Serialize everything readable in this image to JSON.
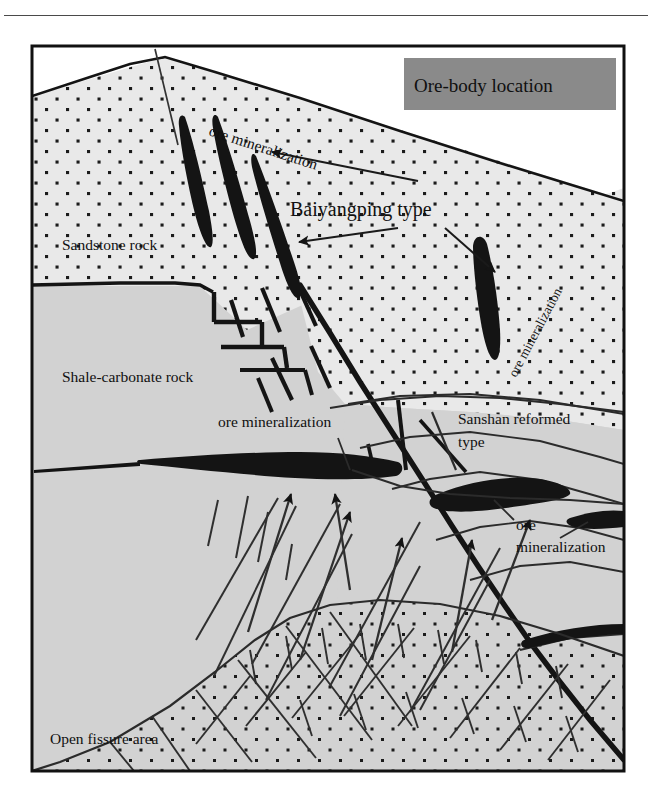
{
  "figure": {
    "kind": "geological-cross-section",
    "frame": {
      "x": 31,
      "y": 45,
      "width": 594,
      "height": 727
    },
    "top_rule_color": "#4a4a4a"
  },
  "title_box": {
    "label": "Ore-body location",
    "fill": "#8a8a8a",
    "text_color": "#101010",
    "x": 404,
    "y": 58,
    "width": 212,
    "height": 52
  },
  "units": [
    {
      "name": "sandstone-rock",
      "label": "Sandstone rock",
      "fill": "#e9e9e9",
      "pattern": "stipple-dots",
      "label_x": 62,
      "label_y": 250
    },
    {
      "name": "shale-carbonate-rock",
      "label": "Shale-carbonate rock",
      "fill": "#d2d2d2",
      "pattern": "solid",
      "label_x": 62,
      "label_y": 382
    },
    {
      "name": "open-fissure-area",
      "label": "Open fissure area",
      "fill": "#d2d2d2",
      "pattern": "stipple-dots-fissures",
      "label_x": 50,
      "label_y": 744
    }
  ],
  "annotations": [
    {
      "name": "ore-mineralization-top",
      "label": "ore  mineralization",
      "x": 208,
      "y": 135,
      "rotate": 18,
      "font_size": 15.5
    },
    {
      "name": "baiyangping-type",
      "label": "Baiyangping type",
      "x": 290,
      "y": 216,
      "rotate": 0,
      "font_size": 20
    },
    {
      "name": "ore-mineralization-right",
      "label": "ore  mineralization",
      "x": 516,
      "y": 378,
      "rotate": -62,
      "font_size": 14.5
    },
    {
      "name": "ore-mineralization-mid",
      "label": "ore  mineralization",
      "x": 218,
      "y": 427,
      "rotate": 0,
      "font_size": 15.5
    },
    {
      "name": "sanshan-reformed-type-line1",
      "label": "Sanshan reformed",
      "x": 458,
      "y": 424,
      "rotate": 0,
      "font_size": 15.5
    },
    {
      "name": "sanshan-reformed-type-line2",
      "label": "type",
      "x": 458,
      "y": 447,
      "rotate": 0,
      "font_size": 15.5
    },
    {
      "name": "ore-mineralization-lower-right",
      "label": "ore",
      "x": 516,
      "y": 530,
      "rotate": 0,
      "font_size": 15.5
    },
    {
      "name": "ore-mineralization-lower-right-2",
      "label": "mineralization",
      "x": 516,
      "y": 552,
      "rotate": 0,
      "font_size": 15.5
    }
  ],
  "colors": {
    "ore_body": "#141414",
    "fault_line": "#141414",
    "bedding_line": "#333333",
    "frame_border": "#111111",
    "sandstone_fill": "#e9e9e9",
    "shale_fill": "#d2d2d2",
    "title_fill": "#8a8a8a",
    "page_background": "#ffffff"
  }
}
